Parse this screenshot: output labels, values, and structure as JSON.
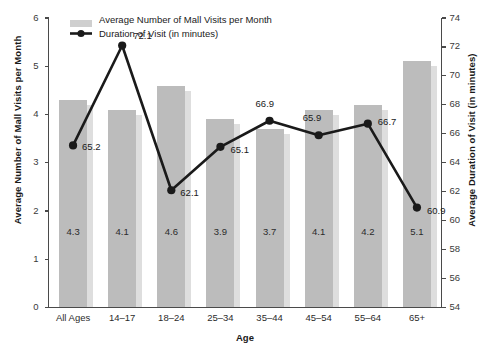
{
  "chart_data": {
    "type": "bar",
    "title": "",
    "categories": [
      "All Ages",
      "14–17",
      "18–24",
      "25–34",
      "35–44",
      "45–54",
      "55–64",
      "65+"
    ],
    "xlabel": "Age",
    "grid": false,
    "legend_position": "top-left",
    "series": [
      {
        "name": "Average Number of Mall Visits per Month",
        "type": "bar",
        "axis": "left",
        "values": [
          4.3,
          4.1,
          4.6,
          3.9,
          3.7,
          4.1,
          4.2,
          5.1
        ],
        "color": "#bcbcbc"
      },
      {
        "name": "Duration of Visit (in minutes)",
        "type": "line",
        "axis": "right",
        "values": [
          65.2,
          72.1,
          62.1,
          65.1,
          66.9,
          65.9,
          66.7,
          60.9
        ],
        "color": "#1a1a1a"
      }
    ],
    "left_axis": {
      "label": "Average Number of Mall Visits per Month",
      "ylim": [
        0,
        6
      ],
      "ticks": [
        "0",
        "1",
        "2",
        "3",
        "4",
        "5",
        "6"
      ]
    },
    "right_axis": {
      "label": "Average Duration of Visit (in minutes)",
      "ylim": [
        54,
        74
      ],
      "ticks": [
        "54",
        "56",
        "58",
        "60",
        "62",
        "64",
        "66",
        "68",
        "70",
        "72",
        "74"
      ]
    },
    "bar_value_labels": [
      "4.3",
      "4.1",
      "4.6",
      "3.9",
      "3.7",
      "4.1",
      "4.2",
      "5.1"
    ],
    "line_value_labels": [
      "65.2",
      "72.1",
      "62.1",
      "65.1",
      "66.9",
      "65.9",
      "66.7",
      "60.9"
    ]
  },
  "legend": {
    "items": [
      {
        "label": "Average Number of Mall Visits per Month",
        "marker": "bar-swatch",
        "color": "#cfcfcf"
      },
      {
        "label": "Duration of Visit (in minutes)",
        "marker": "line-marker",
        "color": "#1a1a1a"
      }
    ]
  }
}
